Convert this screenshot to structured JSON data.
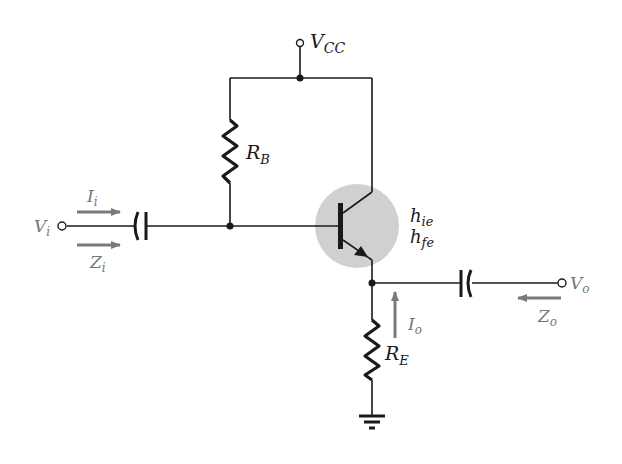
{
  "diagram": {
    "colors": {
      "wire": "#1a1a1a",
      "transistor_highlight": "#cfcfcf",
      "arrow": "#7a7a7a",
      "gray_label": "#777777"
    },
    "labels": {
      "vcc": {
        "main": "V",
        "sub": "CC"
      },
      "rb": {
        "main": "R",
        "sub": "B"
      },
      "re": {
        "main": "R",
        "sub": "E"
      },
      "vi": {
        "main": "V",
        "sub": "i"
      },
      "ii": {
        "main": "I",
        "sub": "i"
      },
      "zi": {
        "main": "Z",
        "sub": "i"
      },
      "vo": {
        "main": "V",
        "sub": "o"
      },
      "io": {
        "main": "I",
        "sub": "o"
      },
      "zo": {
        "main": "Z",
        "sub": "o"
      },
      "hie": {
        "main": "h",
        "sub": "ie"
      },
      "hfe": {
        "main": "h",
        "sub": "fe"
      }
    },
    "components": [
      {
        "id": "vcc-terminal",
        "type": "supply"
      },
      {
        "id": "RB",
        "type": "resistor"
      },
      {
        "id": "RE",
        "type": "resistor"
      },
      {
        "id": "C-in",
        "type": "capacitor"
      },
      {
        "id": "C-out",
        "type": "capacitor"
      },
      {
        "id": "Q1",
        "type": "npn-transistor"
      },
      {
        "id": "ground",
        "type": "ground"
      }
    ]
  }
}
